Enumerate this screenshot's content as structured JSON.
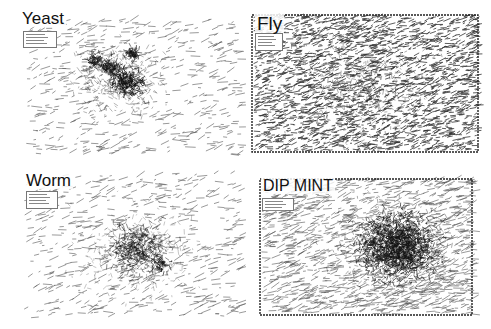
{
  "figure": {
    "panels": [
      {
        "id": "yeast",
        "title": "Yeast",
        "box": {
          "x": 0,
          "y": 0,
          "w": 246,
          "h": 162
        },
        "title_pos": {
          "x": 20,
          "y": 10,
          "size": 17
        },
        "legend": {
          "x": 23,
          "y": 31,
          "w": 32,
          "h": 15
        },
        "frame": false,
        "style": "clustered",
        "seed": 11,
        "edge_count": 520,
        "area": {
          "x": 25,
          "y": 20,
          "w": 215,
          "h": 135
        },
        "clusters": [
          {
            "cx": 128,
            "cy": 82,
            "r": 16,
            "n": 260,
            "dark": 1.0
          },
          {
            "cx": 110,
            "cy": 68,
            "r": 10,
            "n": 130,
            "dark": 0.9
          },
          {
            "cx": 95,
            "cy": 60,
            "r": 8,
            "n": 90,
            "dark": 0.8
          },
          {
            "cx": 133,
            "cy": 53,
            "r": 7,
            "n": 80,
            "dark": 0.85
          },
          {
            "cx": 120,
            "cy": 80,
            "r": 42,
            "n": 420,
            "dark": 0.45
          }
        ]
      },
      {
        "id": "fly",
        "title": "Fly",
        "box": {
          "x": 247,
          "y": 0,
          "w": 244,
          "h": 162
        },
        "title_pos": {
          "x": 8,
          "y": 14,
          "size": 19
        },
        "legend": {
          "x": 8,
          "y": 33,
          "w": 26,
          "h": 16
        },
        "frame": true,
        "frame_rect": {
          "x": 5,
          "y": 15,
          "w": 226,
          "h": 137
        },
        "style": "dense",
        "seed": 23,
        "edge_count": 2400,
        "area": {
          "x": 6,
          "y": 16,
          "w": 224,
          "h": 135
        },
        "clusters": [
          {
            "cx": 120,
            "cy": 85,
            "r": 70,
            "n": 500,
            "dark": 0.5
          }
        ]
      },
      {
        "id": "worm",
        "title": "Worm",
        "box": {
          "x": 0,
          "y": 165,
          "w": 246,
          "h": 164
        },
        "title_pos": {
          "x": 24,
          "y": 7,
          "size": 17
        },
        "legend": {
          "x": 26,
          "y": 26,
          "w": 30,
          "h": 16
        },
        "frame": false,
        "style": "clustered",
        "seed": 37,
        "edge_count": 560,
        "area": {
          "x": 24,
          "y": 8,
          "w": 216,
          "h": 145
        },
        "clusters": [
          {
            "cx": 138,
            "cy": 85,
            "r": 30,
            "n": 520,
            "dark": 0.7
          },
          {
            "cx": 160,
            "cy": 100,
            "r": 8,
            "n": 60,
            "dark": 0.9
          },
          {
            "cx": 136,
            "cy": 88,
            "r": 55,
            "n": 300,
            "dark": 0.35
          }
        ]
      },
      {
        "id": "dip-mint",
        "title": "DIP MINT",
        "box": {
          "x": 247,
          "y": 165,
          "w": 244,
          "h": 164
        },
        "title_pos": {
          "x": 14,
          "y": 13,
          "size": 16
        },
        "legend": {
          "x": 15,
          "y": 33,
          "w": 30,
          "h": 11
        },
        "frame": true,
        "frame_rect": {
          "x": 13,
          "y": 14,
          "w": 212,
          "h": 136
        },
        "style": "blob",
        "seed": 53,
        "edge_count": 1400,
        "area": {
          "x": 14,
          "y": 15,
          "w": 210,
          "h": 134
        },
        "clusters": [
          {
            "cx": 150,
            "cy": 82,
            "r": 38,
            "n": 1500,
            "dark": 0.9
          },
          {
            "cx": 150,
            "cy": 82,
            "r": 60,
            "n": 500,
            "dark": 0.5
          }
        ]
      }
    ]
  }
}
